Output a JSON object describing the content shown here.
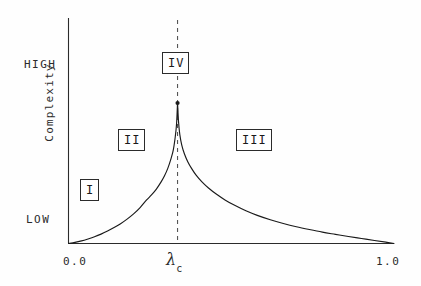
{
  "chart_data": {
    "type": "line",
    "title": "",
    "xlabel": "",
    "ylabel": "Complexity",
    "xlim": [
      0.0,
      1.0
    ],
    "ylim": [
      0,
      1
    ],
    "grid": false,
    "legend": null,
    "x_tick_labels": [
      "0.0",
      "λ",
      "1.0"
    ],
    "x_tick_values": [
      0.0,
      0.335,
      1.0
    ],
    "y_tick_labels": [
      "LOW",
      "HIGH"
    ],
    "y_tick_values": [
      0.12,
      0.82
    ],
    "annotations": [
      {
        "name": "region-I",
        "label": "I",
        "x": 0.05,
        "y": 0.3
      },
      {
        "name": "region-II",
        "label": "II",
        "x": 0.175,
        "y": 0.545
      },
      {
        "name": "region-III",
        "label": "III",
        "x": 0.54,
        "y": 0.545
      },
      {
        "name": "region-IV",
        "label": "IV",
        "x": 0.335,
        "y": 0.9
      }
    ],
    "critical_line": {
      "x": 0.335,
      "style": "dashed",
      "label": "λ_c"
    },
    "peak_marker": {
      "x": 0.335,
      "y": 0.645
    },
    "series": [
      {
        "name": "complexity",
        "x": [
          0.0,
          0.02,
          0.04,
          0.06,
          0.08,
          0.1,
          0.12,
          0.14,
          0.16,
          0.18,
          0.2,
          0.22,
          0.24,
          0.255,
          0.27,
          0.285,
          0.295,
          0.305,
          0.315,
          0.322,
          0.328,
          0.332,
          0.335,
          0.338,
          0.342,
          0.348,
          0.356,
          0.366,
          0.378,
          0.392,
          0.41,
          0.43,
          0.455,
          0.482,
          0.512,
          0.545,
          0.58,
          0.62,
          0.66,
          0.7,
          0.74,
          0.78,
          0.82,
          0.86,
          0.9,
          0.94,
          0.975,
          1.0
        ],
        "y": [
          0.0,
          0.005,
          0.012,
          0.021,
          0.031,
          0.043,
          0.057,
          0.073,
          0.091,
          0.112,
          0.136,
          0.165,
          0.2,
          0.223,
          0.25,
          0.284,
          0.311,
          0.345,
          0.39,
          0.43,
          0.49,
          0.55,
          0.645,
          0.56,
          0.5,
          0.452,
          0.412,
          0.377,
          0.345,
          0.314,
          0.283,
          0.255,
          0.226,
          0.199,
          0.174,
          0.15,
          0.129,
          0.109,
          0.092,
          0.077,
          0.064,
          0.052,
          0.042,
          0.032,
          0.023,
          0.014,
          0.006,
          0.0
        ]
      }
    ]
  },
  "axes": {
    "y_label": "Complexity",
    "y_high": "HIGH",
    "y_low": "LOW",
    "x_min": "0.0",
    "x_max": "1.0",
    "x_critical": "λ",
    "x_critical_sub": "c"
  },
  "regions": {
    "one": "I",
    "two": "II",
    "three": "III",
    "four": "IV"
  },
  "colors": {
    "background": "#fefefe",
    "ink": "#2b2b2b",
    "curve": "#1a1a1a",
    "dashed": "#555555"
  }
}
